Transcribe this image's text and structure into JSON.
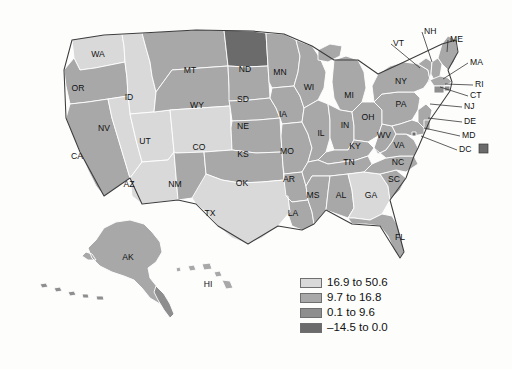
{
  "figure": {
    "type": "choropleth-map",
    "region": "United States",
    "background_color": "#fdfdfc",
    "border_color": "#3c3c3c",
    "state_border_color": "#ffffff"
  },
  "legend": {
    "position": "bottom-right",
    "items": [
      {
        "label": "16.9 to 50.6",
        "color": "#d9d9d9",
        "range_min": 16.9,
        "range_max": 50.6
      },
      {
        "label": "9.7 to 16.8",
        "color": "#a8a8a8",
        "range_min": 9.7,
        "range_max": 16.8
      },
      {
        "label": "0.1 to 9.6",
        "color": "#8e8e8e",
        "range_min": 0.1,
        "range_max": 9.6
      },
      {
        "label": "–14.5 to 0.0",
        "color": "#6b6b6b",
        "range_min": -14.5,
        "range_max": 0.0
      }
    ]
  },
  "chart_data": {
    "type": "heatmap",
    "title": "",
    "classes": [
      "16.9 to 50.6",
      "9.7 to 16.8",
      "0.1 to 9.6",
      "–14.5 to 0.0"
    ],
    "class_colors": [
      "#d9d9d9",
      "#a8a8a8",
      "#8e8e8e",
      "#6b6b6b"
    ],
    "states": [
      {
        "code": "WA",
        "class": 0
      },
      {
        "code": "OR",
        "class": 1
      },
      {
        "code": "ID",
        "class": 0
      },
      {
        "code": "MT",
        "class": 1
      },
      {
        "code": "WY",
        "class": 1
      },
      {
        "code": "ND",
        "class": 3
      },
      {
        "code": "SD",
        "class": 1
      },
      {
        "code": "MN",
        "class": 1
      },
      {
        "code": "WI",
        "class": 1
      },
      {
        "code": "MI",
        "class": 1
      },
      {
        "code": "NY",
        "class": 1
      },
      {
        "code": "PA",
        "class": 1
      },
      {
        "code": "OH",
        "class": 1
      },
      {
        "code": "IN",
        "class": 1
      },
      {
        "code": "IL",
        "class": 1
      },
      {
        "code": "IA",
        "class": 1
      },
      {
        "code": "NE",
        "class": 1
      },
      {
        "code": "CO",
        "class": 0
      },
      {
        "code": "UT",
        "class": 0
      },
      {
        "code": "NV",
        "class": 0
      },
      {
        "code": "CA",
        "class": 1
      },
      {
        "code": "AZ",
        "class": 0
      },
      {
        "code": "NM",
        "class": 1
      },
      {
        "code": "TX",
        "class": 0
      },
      {
        "code": "OK",
        "class": 1
      },
      {
        "code": "KS",
        "class": 1
      },
      {
        "code": "MO",
        "class": 1
      },
      {
        "code": "AR",
        "class": 1
      },
      {
        "code": "LA",
        "class": 1
      },
      {
        "code": "MS",
        "class": 1
      },
      {
        "code": "AL",
        "class": 1
      },
      {
        "code": "GA",
        "class": 0
      },
      {
        "code": "FL",
        "class": 1
      },
      {
        "code": "SC",
        "class": 1
      },
      {
        "code": "NC",
        "class": 1
      },
      {
        "code": "TN",
        "class": 1
      },
      {
        "code": "KY",
        "class": 1
      },
      {
        "code": "WV",
        "class": 1
      },
      {
        "code": "VA",
        "class": 1
      },
      {
        "code": "MD",
        "class": 1
      },
      {
        "code": "DE",
        "class": 1
      },
      {
        "code": "NJ",
        "class": 1
      },
      {
        "code": "CT",
        "class": 2
      },
      {
        "code": "RI",
        "class": 2
      },
      {
        "code": "MA",
        "class": 1
      },
      {
        "code": "VT",
        "class": 1
      },
      {
        "code": "NH",
        "class": 1
      },
      {
        "code": "ME",
        "class": 1
      },
      {
        "code": "DC",
        "class": 3
      },
      {
        "code": "AK",
        "class": 1
      },
      {
        "code": "HI",
        "class": 1
      }
    ]
  },
  "labels": {
    "inline": [
      {
        "code": "WA",
        "x": 98,
        "y": 55
      },
      {
        "code": "OR",
        "x": 78,
        "y": 89
      },
      {
        "code": "ID",
        "x": 129,
        "y": 98
      },
      {
        "code": "MT",
        "x": 190,
        "y": 71
      },
      {
        "code": "ND",
        "x": 245,
        "y": 70
      },
      {
        "code": "SD",
        "x": 243,
        "y": 100
      },
      {
        "code": "MN",
        "x": 280,
        "y": 73
      },
      {
        "code": "WI",
        "x": 309,
        "y": 88
      },
      {
        "code": "MI",
        "x": 349,
        "y": 96
      },
      {
        "code": "WY",
        "x": 197,
        "y": 106
      },
      {
        "code": "NV",
        "x": 104,
        "y": 129
      },
      {
        "code": "UT",
        "x": 145,
        "y": 142
      },
      {
        "code": "CO",
        "x": 199,
        "y": 148
      },
      {
        "code": "NE",
        "x": 243,
        "y": 127
      },
      {
        "code": "IA",
        "x": 283,
        "y": 115
      },
      {
        "code": "IL",
        "x": 321,
        "y": 134
      },
      {
        "code": "IN",
        "x": 345,
        "y": 126
      },
      {
        "code": "OH",
        "x": 368,
        "y": 118
      },
      {
        "code": "PA",
        "x": 401,
        "y": 105
      },
      {
        "code": "NY",
        "x": 401,
        "y": 82
      },
      {
        "code": "CA",
        "x": 77,
        "y": 157
      },
      {
        "code": "AZ",
        "x": 129,
        "y": 185
      },
      {
        "code": "NM",
        "x": 175,
        "y": 185
      },
      {
        "code": "KS",
        "x": 243,
        "y": 155
      },
      {
        "code": "MO",
        "x": 287,
        "y": 152
      },
      {
        "code": "KY",
        "x": 355,
        "y": 147
      },
      {
        "code": "WV",
        "x": 384,
        "y": 136
      },
      {
        "code": "VA",
        "x": 399,
        "y": 146
      },
      {
        "code": "TN",
        "x": 349,
        "y": 163
      },
      {
        "code": "NC",
        "x": 398,
        "y": 163
      },
      {
        "code": "SC",
        "x": 394,
        "y": 180
      },
      {
        "code": "OK",
        "x": 242,
        "y": 184
      },
      {
        "code": "AR",
        "x": 289,
        "y": 180
      },
      {
        "code": "MS",
        "x": 313,
        "y": 196
      },
      {
        "code": "AL",
        "x": 341,
        "y": 196
      },
      {
        "code": "GA",
        "x": 371,
        "y": 196
      },
      {
        "code": "TX",
        "x": 210,
        "y": 214
      },
      {
        "code": "LA",
        "x": 293,
        "y": 214
      },
      {
        "code": "FL",
        "x": 400,
        "y": 238
      },
      {
        "code": "AK",
        "x": 128,
        "y": 258
      },
      {
        "code": "HI",
        "x": 208,
        "y": 285
      }
    ],
    "callouts": [
      {
        "code": "VT",
        "x": 393,
        "y": 44,
        "lx": 420,
        "ly": 68
      },
      {
        "code": "NH",
        "x": 424,
        "y": 32,
        "lx": 432,
        "ly": 62
      },
      {
        "code": "ME",
        "x": 450,
        "y": 40,
        "lx": 447,
        "ly": 52
      },
      {
        "code": "MA",
        "x": 470,
        "y": 63,
        "lx": 443,
        "ly": 79
      },
      {
        "code": "RI",
        "x": 475,
        "y": 85,
        "lx": 445,
        "ly": 84
      },
      {
        "code": "CT",
        "x": 470,
        "y": 96,
        "lx": 440,
        "ly": 87
      },
      {
        "code": "NJ",
        "x": 464,
        "y": 107,
        "lx": 430,
        "ly": 104
      },
      {
        "code": "DE",
        "x": 464,
        "y": 122,
        "lx": 428,
        "ly": 118
      },
      {
        "code": "MD",
        "x": 462,
        "y": 136,
        "lx": 424,
        "ly": 128
      },
      {
        "code": "DC",
        "x": 459,
        "y": 150,
        "lx": 421,
        "ly": 136
      }
    ],
    "dc_swatch": {
      "x": 479,
      "y": 144,
      "size": 9,
      "color": "#6b6b6b"
    }
  }
}
